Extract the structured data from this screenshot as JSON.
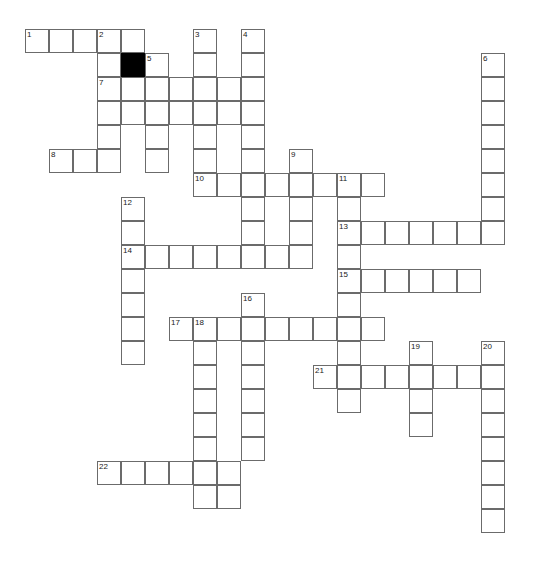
{
  "puzzle": {
    "type": "crossword-grid",
    "title": "",
    "cell_size": 24,
    "origin_x": 25,
    "origin_y": 29,
    "colors": {
      "background": "#ffffff",
      "cell_fill": "#ffffff",
      "cell_border": "#6b6b6b",
      "blocked_fill": "#000000",
      "number_text": "#1a1a1a"
    },
    "counts": {
      "numbered_clues": 22,
      "blocked_cells": 1
    },
    "entries": [
      {
        "number": "1",
        "direction": "across",
        "col": 0,
        "row": 0,
        "length": 5
      },
      {
        "number": "2",
        "direction": "down",
        "col": 3,
        "row": 0,
        "length": 7
      },
      {
        "number": "3",
        "direction": "down",
        "col": 7,
        "row": 0,
        "length": 6
      },
      {
        "number": "4",
        "direction": "down",
        "col": 9,
        "row": 0,
        "length": 9
      },
      {
        "number": "5",
        "direction": "down",
        "col": 5,
        "row": 1,
        "length": 7
      },
      {
        "number": "6",
        "direction": "down",
        "col": 19,
        "row": 1,
        "length": 8
      },
      {
        "number": "7",
        "direction": "across",
        "col": 3,
        "row": 2,
        "length": 7
      },
      {
        "number": "8",
        "direction": "across",
        "col": 1,
        "row": 5,
        "length": 3
      },
      {
        "number": "9",
        "direction": "down",
        "col": 11,
        "row": 5,
        "length": 5
      },
      {
        "number": "10",
        "direction": "across",
        "col": 7,
        "row": 6,
        "length": 8
      },
      {
        "number": "11",
        "direction": "down",
        "col": 13,
        "row": 6,
        "length": 10
      },
      {
        "number": "12",
        "direction": "down",
        "col": 4,
        "row": 7,
        "length": 7
      },
      {
        "number": "13",
        "direction": "across",
        "col": 13,
        "row": 8,
        "length": 7
      },
      {
        "number": "14",
        "direction": "across",
        "col": 4,
        "row": 9,
        "length": 7
      },
      {
        "number": "15",
        "direction": "across",
        "col": 13,
        "row": 10,
        "length": 6
      },
      {
        "number": "16",
        "direction": "down",
        "col": 9,
        "row": 11,
        "length": 8
      },
      {
        "number": "17",
        "direction": "across",
        "col": 6,
        "row": 12,
        "length": 9
      },
      {
        "number": "18",
        "direction": "down",
        "col": 7,
        "row": 12,
        "length": 9
      },
      {
        "number": "19",
        "direction": "down",
        "col": 16,
        "row": 13,
        "length": 4
      },
      {
        "number": "20",
        "direction": "down",
        "col": 19,
        "row": 13,
        "length": 8
      },
      {
        "number": "21",
        "direction": "across",
        "col": 12,
        "row": 14,
        "length": 8
      },
      {
        "number": "22",
        "direction": "across",
        "col": 3,
        "row": 18,
        "length": 6
      }
    ],
    "cells": [
      {
        "c": 0,
        "r": 0
      },
      {
        "c": 1,
        "r": 0
      },
      {
        "c": 2,
        "r": 0
      },
      {
        "c": 3,
        "r": 0
      },
      {
        "c": 4,
        "r": 0
      },
      {
        "c": 7,
        "r": 0
      },
      {
        "c": 9,
        "r": 0
      },
      {
        "c": 3,
        "r": 1
      },
      {
        "c": 4,
        "r": 1,
        "blocked": true
      },
      {
        "c": 5,
        "r": 1
      },
      {
        "c": 7,
        "r": 1
      },
      {
        "c": 9,
        "r": 1
      },
      {
        "c": 19,
        "r": 1
      },
      {
        "c": 3,
        "r": 2
      },
      {
        "c": 4,
        "r": 2
      },
      {
        "c": 5,
        "r": 2
      },
      {
        "c": 6,
        "r": 2
      },
      {
        "c": 7,
        "r": 2
      },
      {
        "c": 8,
        "r": 2
      },
      {
        "c": 9,
        "r": 2
      },
      {
        "c": 19,
        "r": 2
      },
      {
        "c": 3,
        "r": 3
      },
      {
        "c": 4,
        "r": 3
      },
      {
        "c": 5,
        "r": 3
      },
      {
        "c": 6,
        "r": 3
      },
      {
        "c": 7,
        "r": 3
      },
      {
        "c": 8,
        "r": 3
      },
      {
        "c": 9,
        "r": 3
      },
      {
        "c": 19,
        "r": 3
      },
      {
        "c": 3,
        "r": 4
      },
      {
        "c": 5,
        "r": 4
      },
      {
        "c": 7,
        "r": 4
      },
      {
        "c": 9,
        "r": 4
      },
      {
        "c": 19,
        "r": 4
      },
      {
        "c": 1,
        "r": 5
      },
      {
        "c": 2,
        "r": 5
      },
      {
        "c": 3,
        "r": 5
      },
      {
        "c": 5,
        "r": 5
      },
      {
        "c": 7,
        "r": 5
      },
      {
        "c": 9,
        "r": 5
      },
      {
        "c": 11,
        "r": 5
      },
      {
        "c": 19,
        "r": 5
      },
      {
        "c": 7,
        "r": 6
      },
      {
        "c": 8,
        "r": 6
      },
      {
        "c": 9,
        "r": 6
      },
      {
        "c": 10,
        "r": 6
      },
      {
        "c": 11,
        "r": 6
      },
      {
        "c": 12,
        "r": 6
      },
      {
        "c": 13,
        "r": 6
      },
      {
        "c": 14,
        "r": 6
      },
      {
        "c": 19,
        "r": 6
      },
      {
        "c": 4,
        "r": 7
      },
      {
        "c": 9,
        "r": 7
      },
      {
        "c": 11,
        "r": 7
      },
      {
        "c": 13,
        "r": 7
      },
      {
        "c": 19,
        "r": 7
      },
      {
        "c": 4,
        "r": 8
      },
      {
        "c": 9,
        "r": 8
      },
      {
        "c": 11,
        "r": 8
      },
      {
        "c": 13,
        "r": 8
      },
      {
        "c": 14,
        "r": 8
      },
      {
        "c": 15,
        "r": 8
      },
      {
        "c": 16,
        "r": 8
      },
      {
        "c": 17,
        "r": 8
      },
      {
        "c": 18,
        "r": 8
      },
      {
        "c": 19,
        "r": 8
      },
      {
        "c": 4,
        "r": 9
      },
      {
        "c": 5,
        "r": 9
      },
      {
        "c": 6,
        "r": 9
      },
      {
        "c": 7,
        "r": 9
      },
      {
        "c": 8,
        "r": 9
      },
      {
        "c": 9,
        "r": 9
      },
      {
        "c": 10,
        "r": 9
      },
      {
        "c": 11,
        "r": 9
      },
      {
        "c": 13,
        "r": 9
      },
      {
        "c": 4,
        "r": 10
      },
      {
        "c": 13,
        "r": 10
      },
      {
        "c": 14,
        "r": 10
      },
      {
        "c": 15,
        "r": 10
      },
      {
        "c": 16,
        "r": 10
      },
      {
        "c": 17,
        "r": 10
      },
      {
        "c": 18,
        "r": 10
      },
      {
        "c": 4,
        "r": 11
      },
      {
        "c": 9,
        "r": 11
      },
      {
        "c": 13,
        "r": 11
      },
      {
        "c": 4,
        "r": 12
      },
      {
        "c": 6,
        "r": 12
      },
      {
        "c": 7,
        "r": 12
      },
      {
        "c": 8,
        "r": 12
      },
      {
        "c": 9,
        "r": 12
      },
      {
        "c": 10,
        "r": 12
      },
      {
        "c": 11,
        "r": 12
      },
      {
        "c": 12,
        "r": 12
      },
      {
        "c": 13,
        "r": 12
      },
      {
        "c": 14,
        "r": 12
      },
      {
        "c": 4,
        "r": 13
      },
      {
        "c": 7,
        "r": 13
      },
      {
        "c": 9,
        "r": 13
      },
      {
        "c": 13,
        "r": 13
      },
      {
        "c": 16,
        "r": 13
      },
      {
        "c": 19,
        "r": 13
      },
      {
        "c": 7,
        "r": 14
      },
      {
        "c": 9,
        "r": 14
      },
      {
        "c": 12,
        "r": 14
      },
      {
        "c": 13,
        "r": 14
      },
      {
        "c": 14,
        "r": 14
      },
      {
        "c": 15,
        "r": 14
      },
      {
        "c": 16,
        "r": 14
      },
      {
        "c": 17,
        "r": 14
      },
      {
        "c": 18,
        "r": 14
      },
      {
        "c": 19,
        "r": 14
      },
      {
        "c": 7,
        "r": 15
      },
      {
        "c": 9,
        "r": 15
      },
      {
        "c": 13,
        "r": 15
      },
      {
        "c": 16,
        "r": 15
      },
      {
        "c": 19,
        "r": 15
      },
      {
        "c": 7,
        "r": 16
      },
      {
        "c": 9,
        "r": 16
      },
      {
        "c": 16,
        "r": 16
      },
      {
        "c": 19,
        "r": 16
      },
      {
        "c": 7,
        "r": 17
      },
      {
        "c": 9,
        "r": 17
      },
      {
        "c": 19,
        "r": 17
      },
      {
        "c": 3,
        "r": 18
      },
      {
        "c": 4,
        "r": 18
      },
      {
        "c": 5,
        "r": 18
      },
      {
        "c": 6,
        "r": 18
      },
      {
        "c": 7,
        "r": 18
      },
      {
        "c": 8,
        "r": 18
      },
      {
        "c": 19,
        "r": 18
      },
      {
        "c": 7,
        "r": 19
      },
      {
        "c": 8,
        "r": 19
      },
      {
        "c": 19,
        "r": 19
      },
      {
        "c": 19,
        "r": 20
      }
    ]
  }
}
